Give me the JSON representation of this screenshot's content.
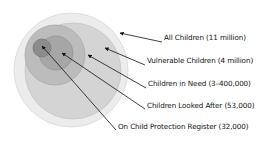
{
  "diagram": {
    "type": "nested-circles",
    "circles": [
      {
        "id": "all-children",
        "label": "All Children (11 million)",
        "cx": 71,
        "cy": 70,
        "r": 57,
        "fill": "#ececec",
        "stroke": "#d8d8d8"
      },
      {
        "id": "vulnerable-children",
        "label": "Vulnerable Children (4 million)",
        "cx": 73,
        "cy": 71,
        "r": 48,
        "fill": "#d4d4d4",
        "stroke": "#c4c4c4"
      },
      {
        "id": "children-in-need",
        "label": "Children in Need (3–400,000)",
        "cx": 55,
        "cy": 55,
        "r": 30,
        "fill": "#bcbcbc",
        "stroke": "#aaaaaa"
      },
      {
        "id": "children-looked-after",
        "label": "Children Looked After (53,000)",
        "cx": 56,
        "cy": 53,
        "r": 17,
        "fill": "#a6a6a6",
        "stroke": "#959595"
      },
      {
        "id": "child-protection-register",
        "label": "On Child Protection Register (32,000)",
        "cx": 42,
        "cy": 48,
        "r": 9,
        "fill": "#8c8c8c",
        "stroke": "#7a7a7a"
      }
    ],
    "labels": [
      {
        "text": "All Children (11 million)",
        "x": 164,
        "y": 39,
        "arrow": {
          "x1": 162,
          "y1": 42,
          "x2": 120,
          "y2": 33
        }
      },
      {
        "text": "Vulnerable Children (4 million)",
        "x": 147,
        "y": 62,
        "arrow": {
          "x1": 145,
          "y1": 65,
          "x2": 105,
          "y2": 48
        }
      },
      {
        "text": "Children in Need (3–400,000)",
        "x": 148,
        "y": 85,
        "arrow": {
          "x1": 146,
          "y1": 88,
          "x2": 88,
          "y2": 55
        }
      },
      {
        "text": "Children Looked After (53,000)",
        "x": 147,
        "y": 107,
        "arrow": {
          "x1": 145,
          "y1": 109,
          "x2": 62,
          "y2": 53
        }
      },
      {
        "text": "On Child Protection Register (32,000)",
        "x": 118,
        "y": 128,
        "arrow": {
          "x1": 116,
          "y1": 130,
          "x2": 42,
          "y2": 46
        }
      }
    ]
  }
}
